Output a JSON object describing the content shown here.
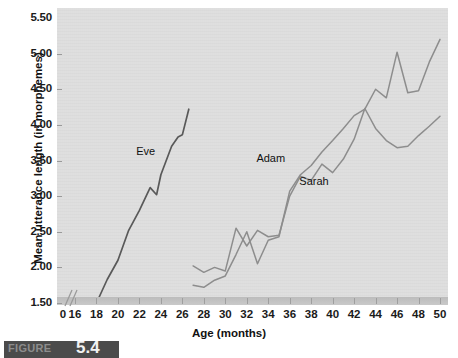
{
  "figure": {
    "caption_label": "FIGURE",
    "caption_number": "5.4"
  },
  "chart_data": {
    "type": "line",
    "title": "",
    "xlabel": "Age (months)",
    "ylabel": "Mean utterance length (in morphemes)",
    "xlim": [
      16,
      50
    ],
    "ylim": [
      1.5,
      5.5
    ],
    "x_axis_break_after": 0,
    "grid": false,
    "legend_position": "inline-annotations",
    "xticks": [
      0,
      16,
      18,
      20,
      22,
      24,
      26,
      28,
      30,
      32,
      34,
      36,
      38,
      40,
      42,
      44,
      46,
      48,
      50
    ],
    "ytick_labels": [
      "1.50",
      "2.00",
      "2.50",
      "3.00",
      "3.50",
      "4.00",
      "4.50",
      "5.00",
      "5.50"
    ],
    "yticks": [
      1.5,
      2.0,
      2.5,
      3.0,
      3.5,
      4.0,
      4.5,
      5.0,
      5.5
    ],
    "series": [
      {
        "name": "Eve",
        "color": "#595959",
        "label_x": 23.0,
        "label_y": 3.62,
        "x": [
          18,
          19,
          20,
          21,
          22,
          23,
          23.6,
          24,
          25,
          25.6,
          26,
          26.6
        ],
        "y": [
          1.5,
          1.83,
          2.1,
          2.52,
          2.8,
          3.12,
          3.02,
          3.3,
          3.7,
          3.83,
          3.86,
          4.22
        ]
      },
      {
        "name": "Adam",
        "color": "#8d8d8d",
        "label_x": 34.2,
        "label_y": 3.52,
        "x": [
          27,
          28,
          29,
          30,
          31,
          32,
          33,
          34,
          35,
          36,
          37,
          38,
          39,
          40,
          41,
          42,
          43,
          44,
          45,
          46,
          47,
          48,
          49,
          50
        ],
        "y": [
          1.75,
          1.72,
          1.82,
          1.88,
          2.18,
          2.5,
          2.05,
          2.38,
          2.43,
          3.07,
          3.3,
          3.43,
          3.62,
          3.78,
          3.95,
          4.13,
          4.22,
          4.5,
          4.38,
          5.02,
          4.45,
          4.48,
          4.88,
          5.2
        ]
      },
      {
        "name": "Sarah",
        "color": "#8d8d8d",
        "label_x": 38.2,
        "label_y": 3.2,
        "x": [
          27,
          28,
          29,
          30,
          31,
          32,
          33,
          34,
          35,
          36,
          37,
          38,
          39,
          40,
          41,
          42,
          43,
          44,
          45,
          46,
          47,
          48,
          49,
          50
        ],
        "y": [
          2.02,
          1.93,
          2.0,
          1.95,
          2.55,
          2.3,
          2.52,
          2.43,
          2.45,
          3.0,
          3.28,
          3.22,
          3.45,
          3.33,
          3.52,
          3.8,
          4.23,
          3.95,
          3.78,
          3.68,
          3.7,
          3.85,
          3.98,
          4.12
        ]
      }
    ]
  }
}
